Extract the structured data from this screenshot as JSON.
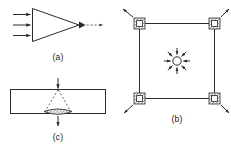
{
  "figure": {
    "background_color": "#ffffff",
    "line_color": "#2b2b2b",
    "dashed_line_color": "#555555",
    "width": 231,
    "height": 149,
    "panels": [
      {
        "id": "a",
        "label": "(a)",
        "description": "Converging beam: three parallel horizontal arrows enter the flat left edge of a triangle (wedge) and converge to a point at its right apex, where a small arrowhead emits a dashed ray continuing to the right.",
        "elements": {
          "wedge_shape": "triangle",
          "input_arrow_count": 3,
          "input_arrow_direction": "right",
          "focus_marker": "arrowhead-at-apex",
          "output_ray_style": "dashed",
          "output_arrow_direction": "right"
        }
      },
      {
        "id": "b",
        "label": "(b)",
        "description": "Square frame with a hatched clamp block at each of the four corners; each corner block has a diagonal arrow pointing outward away from the square. At the center a small open circle radiates eight arrows outward in a star pattern.",
        "elements": {
          "frame_shape": "square",
          "corner_block_count": 4,
          "corner_block_fill": "hatched",
          "corner_arrow_direction": "outward-diagonal",
          "center_marker": "open-circle",
          "center_ray_count": 8,
          "center_ray_direction": "outward-radial"
        }
      },
      {
        "id": "c",
        "label": "(c)",
        "description": "Horizontal rectangular bar (plate) seen edge-on. A solid arrow points downward into the top surface. A dashed triangle spreads from the entry point down through the plate to a hatched lens-shaped zone at the bottom face, from which a solid arrow continues downward.",
        "elements": {
          "plate_shape": "rectangle",
          "input_arrow_direction": "down",
          "spread_style": "dashed-triangle",
          "exit_zone_fill": "hatched-lens",
          "output_arrow_direction": "down"
        }
      }
    ]
  }
}
